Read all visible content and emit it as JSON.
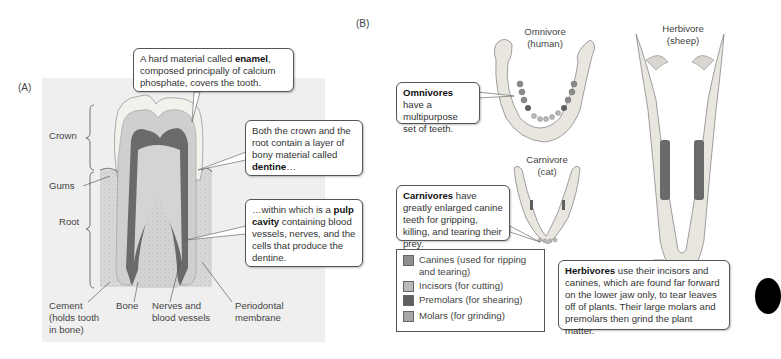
{
  "panel_a": {
    "label": "(A)",
    "callouts": {
      "enamel": {
        "pre": "A hard material called ",
        "bold": "enamel",
        "post": ", composed principally of calcium phosphate, covers the tooth."
      },
      "dentine": {
        "pre": "Both the crown and the root contain a layer of bony material called ",
        "bold": "dentine",
        "post": "…"
      },
      "pulp": {
        "pre": "…within which is a ",
        "bold": "pulp cavity",
        "post": " containing blood vessels, nerves, and the cells that produce the dentine."
      }
    },
    "labels": {
      "crown": "Crown",
      "gums": "Gums",
      "root": "Root",
      "cement_1": "Cement",
      "cement_2": "(holds tooth",
      "cement_3": "in bone)",
      "bone": "Bone",
      "nerves_1": "Nerves and",
      "nerves_2": "blood vessels",
      "periodontal_1": "Periodontal",
      "periodontal_2": "membrane"
    }
  },
  "panel_b": {
    "label": "(B)",
    "titles": {
      "omnivore_1": "Omnivore",
      "omnivore_2": "(human)",
      "herbivore_1": "Herbivore",
      "herbivore_2": "(sheep)",
      "carnivore_1": "Carnivore",
      "carnivore_2": "(cat)"
    },
    "callouts": {
      "omnivores": {
        "bold": "Omnivores",
        "post": " have a multipurpose set of teeth."
      },
      "carnivores": {
        "bold": "Carnivores",
        "post": " have greatly enlarged canine teeth for gripping, killing, and tearing their prey."
      },
      "herbivores": {
        "bold": "Herbivores",
        "post": " use their incisors and canines, which are found far forward on the lower jaw only, to tear leaves off of plants. Their large molars and premolars then grind the plant matter."
      }
    },
    "legend": [
      {
        "label": "Canines (used for ripping and tearing)",
        "color": "#8e8e8e"
      },
      {
        "label": "Incisors (for cutting)",
        "color": "#b9b9b9"
      },
      {
        "label": "Premolars (for shearing)",
        "color": "#5f5f5f"
      },
      {
        "label": "Molars (for grinding)",
        "color": "#a6a6a6"
      }
    ]
  }
}
